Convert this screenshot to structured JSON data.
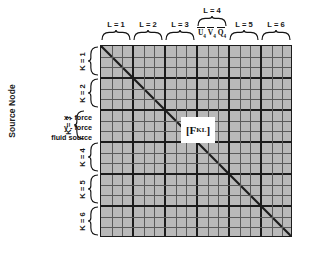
{
  "figure": {
    "axis_title_y": "Source Node",
    "center_matrix_label": "[F",
    "center_matrix_superscript": "KL"
  },
  "columns": {
    "labels": [
      {
        "id": "L1",
        "text": "L = 1"
      },
      {
        "id": "L2",
        "text": "L = 2"
      },
      {
        "id": "L3",
        "text": "L = 3"
      },
      {
        "id": "L4",
        "text": "L = 4"
      },
      {
        "id": "L5",
        "text": "L = 5"
      },
      {
        "id": "L6",
        "text": "L = 6"
      }
    ],
    "detail_block": "L4",
    "detail_vars": [
      {
        "symbol": "U",
        "sub": "4"
      },
      {
        "symbol": "V",
        "sub": "4"
      },
      {
        "symbol": "Q",
        "sub": "4"
      }
    ]
  },
  "rows": {
    "labels": [
      {
        "id": "K1",
        "text": "K = 1"
      },
      {
        "id": "K2",
        "text": "K = 2"
      },
      {
        "id": "K3",
        "text": "K = 3"
      },
      {
        "id": "K4",
        "text": "K = 4"
      },
      {
        "id": "K5",
        "text": "K = 5"
      },
      {
        "id": "K6",
        "text": "K = 6"
      }
    ],
    "detail_block": "K3",
    "detail_items": [
      "x - force",
      "y - force",
      "fluid source"
    ]
  },
  "grid": {
    "blocks": 6,
    "cells_per_block": 3,
    "fill_color": "#b9b9b9",
    "thick_line_color": "#1c1c1c",
    "thin_line_color": "#5a5a5a",
    "diagonal_color": "#1c1c1c"
  }
}
